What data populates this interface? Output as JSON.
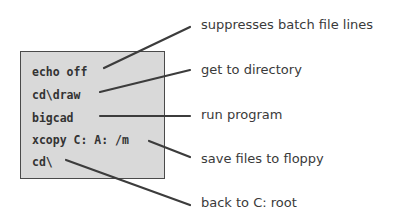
{
  "diagram": {
    "code_box": {
      "background": "#d9d9d9",
      "border_color": "#4a4a4a",
      "lines": [
        "echo off",
        "cd\\draw",
        "bigcad",
        "xcopy C: A: /m",
        "cd\\"
      ]
    },
    "annotations": [
      "suppresses batch file lines",
      "get to directory",
      "run program",
      "save files to floppy",
      "back to C: root"
    ],
    "leader_color": "#3c3c3c"
  }
}
